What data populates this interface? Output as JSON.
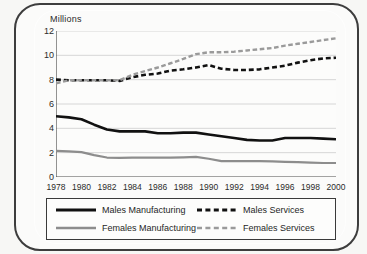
{
  "chart_data": {
    "type": "line",
    "title": "",
    "subtitle": "",
    "ylabel": "Millions",
    "xlabel": "",
    "ylim": [
      0,
      12
    ],
    "xlim": [
      1978,
      2000
    ],
    "yticks": [
      0,
      2,
      4,
      6,
      8,
      10,
      12
    ],
    "xticks": [
      1978,
      1980,
      1982,
      1984,
      1986,
      1988,
      1990,
      1992,
      1994,
      1996,
      1998,
      2000
    ],
    "minor_xticks": [
      1979,
      1981,
      1983,
      1985,
      1987,
      1989,
      1991,
      1993,
      1995,
      1997,
      1999
    ],
    "grid": "horizontal",
    "legend_position": "below",
    "x": [
      1978,
      1979,
      1980,
      1981,
      1982,
      1983,
      1984,
      1985,
      1986,
      1987,
      1988,
      1989,
      1990,
      1991,
      1992,
      1993,
      1994,
      1995,
      1996,
      1997,
      1998,
      1999,
      2000
    ],
    "series": [
      {
        "name": "Males Manufacturing",
        "color": "#111111",
        "style": "solid",
        "width": 2.6,
        "values": [
          5.0,
          4.9,
          4.75,
          4.3,
          3.9,
          3.75,
          3.75,
          3.75,
          3.6,
          3.6,
          3.65,
          3.65,
          3.5,
          3.35,
          3.2,
          3.05,
          3.0,
          3.0,
          3.2,
          3.2,
          3.2,
          3.15,
          3.1
        ]
      },
      {
        "name": "Females Manufacturing",
        "color": "#8d8d8d",
        "style": "solid",
        "width": 2.2,
        "values": [
          2.15,
          2.1,
          2.05,
          1.8,
          1.6,
          1.58,
          1.6,
          1.6,
          1.6,
          1.6,
          1.62,
          1.65,
          1.5,
          1.3,
          1.3,
          1.3,
          1.3,
          1.28,
          1.25,
          1.22,
          1.18,
          1.15,
          1.15
        ]
      },
      {
        "name": "Males Services",
        "color": "#111111",
        "style": "dashed",
        "width": 2.6,
        "values": [
          8.0,
          7.95,
          7.95,
          7.95,
          7.95,
          7.9,
          8.2,
          8.4,
          8.5,
          8.75,
          8.85,
          9.0,
          9.2,
          8.9,
          8.8,
          8.8,
          8.85,
          9.0,
          9.15,
          9.4,
          9.6,
          9.75,
          9.8
        ]
      },
      {
        "name": "Females Services",
        "color": "#9a9a9a",
        "style": "dashed",
        "width": 2.4,
        "values": [
          7.7,
          7.95,
          7.95,
          7.95,
          7.95,
          7.95,
          8.4,
          8.7,
          9.0,
          9.35,
          9.7,
          10.1,
          10.25,
          10.25,
          10.3,
          10.4,
          10.5,
          10.6,
          10.8,
          10.95,
          11.1,
          11.25,
          11.4
        ]
      }
    ]
  },
  "legend": {
    "entries": [
      {
        "label": "Males Manufacturing",
        "style": "solid",
        "color": "#111111",
        "width": 3.2
      },
      {
        "label": "Males Services",
        "style": "dashed",
        "color": "#111111",
        "width": 3.2
      },
      {
        "label": "Females Manufacturing",
        "style": "solid",
        "color": "#8d8d8d",
        "width": 2.6
      },
      {
        "label": "Females Services",
        "style": "dashed",
        "color": "#9a9a9a",
        "width": 2.6
      }
    ]
  },
  "colors": {
    "axis": "#4a4a4a",
    "grid": "#d6d6d6",
    "frame": "#3d3d3d",
    "text": "#2b2b2b",
    "plot_background": "#fcfcfb",
    "page_background": "#f7f7f5"
  }
}
